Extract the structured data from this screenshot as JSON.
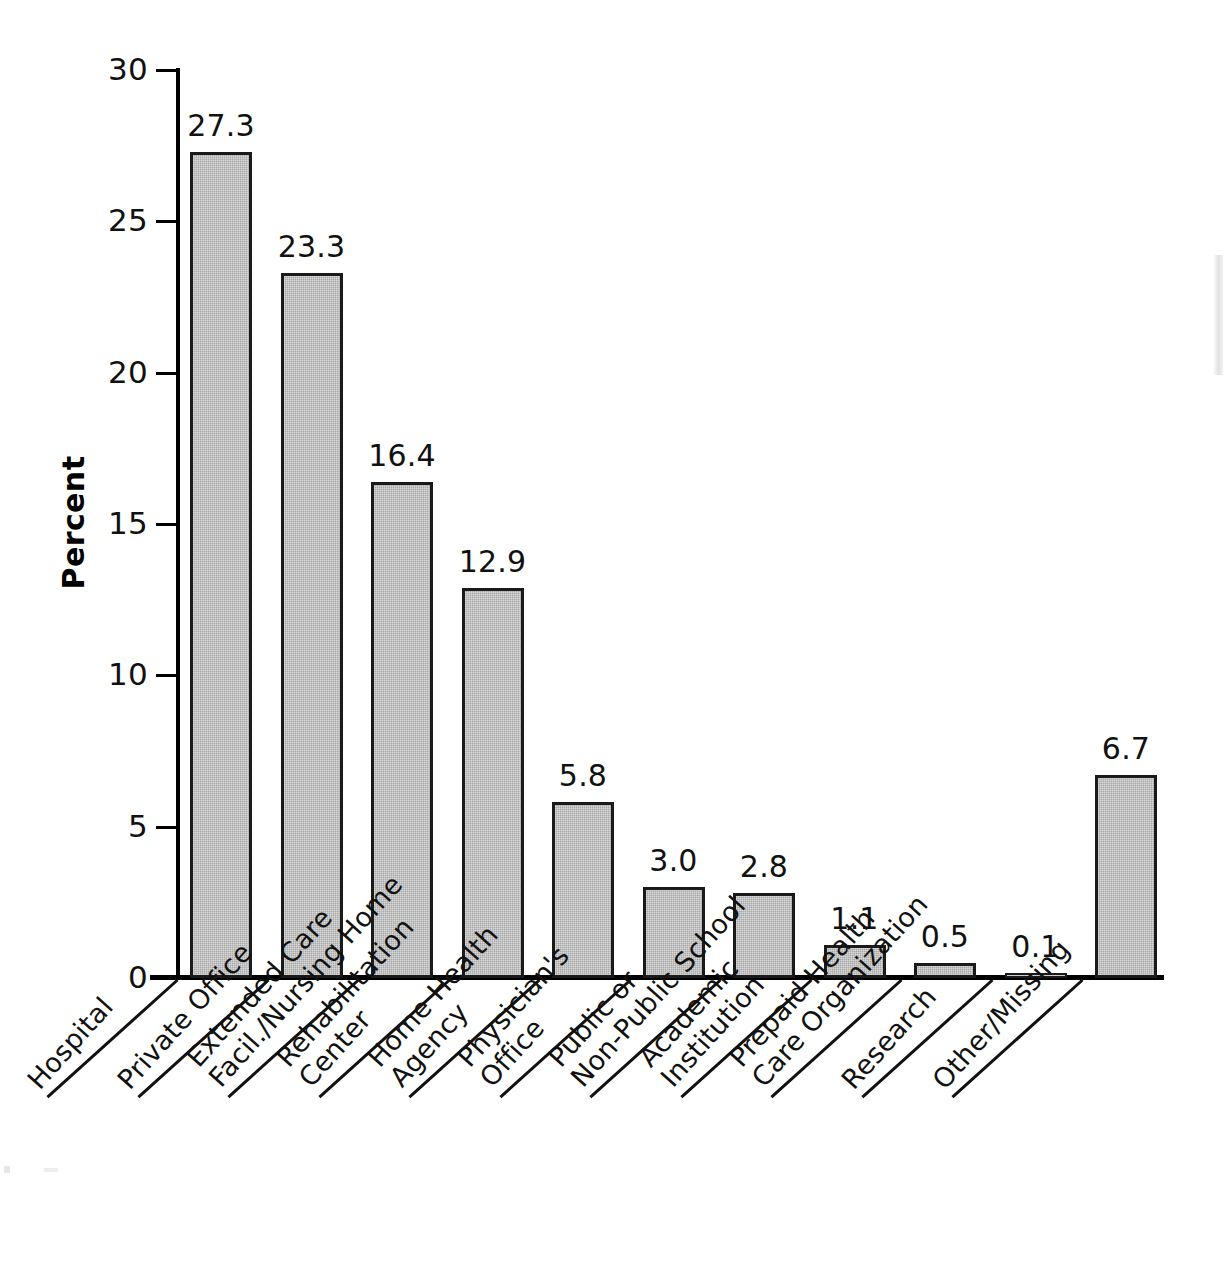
{
  "chart_data": {
    "type": "bar",
    "title": "",
    "xlabel": "",
    "ylabel": "Percent",
    "ylim": [
      0,
      30
    ],
    "yticks": [
      "0",
      "5",
      "10",
      "15",
      "20",
      "25",
      "30"
    ],
    "ytick_values": [
      0,
      5,
      10,
      15,
      20,
      25,
      30
    ],
    "grid": false,
    "legend": null,
    "bar_color": "#a9a9a9",
    "bar_edge_color": "#1a1a1a",
    "categories": [
      "Hospital",
      "Private Office",
      "Extended Care Facil./Nursing Home",
      "Rehabilitation Center",
      "Home Health Agency",
      "Physician's Office",
      "Public or Non-Public School",
      "Academic Institution",
      "Prepaid Health Care Organization",
      "Research",
      "Other/Missing"
    ],
    "values": [
      27.3,
      23.3,
      16.4,
      12.9,
      5.8,
      3.0,
      2.8,
      1.1,
      0.5,
      0.1,
      6.7
    ],
    "value_labels": [
      "27.3",
      "23.3",
      "16.4",
      "12.9",
      "5.8",
      "3.0",
      "2.8",
      "1.1",
      "0.5",
      "0.1",
      "6.7"
    ],
    "category_lines": [
      [
        "Hospital",
        ""
      ],
      [
        "Private Office",
        ""
      ],
      [
        "Extended Care",
        "Facil./Nursing Home"
      ],
      [
        "Rehabilitation",
        "Center"
      ],
      [
        "Home Health",
        "Agency"
      ],
      [
        "Physician's",
        "Office"
      ],
      [
        "Public or",
        "Non-Public School"
      ],
      [
        "Academic",
        "Institution"
      ],
      [
        "Prepaid Health",
        "Care Organization"
      ],
      [
        "Research",
        ""
      ],
      [
        "Other/Missing",
        ""
      ]
    ]
  }
}
